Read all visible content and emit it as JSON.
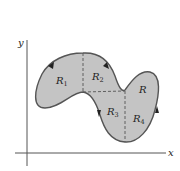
{
  "diagram": {
    "axes": {
      "x_label": "x",
      "y_label": "y"
    },
    "region": {
      "label": "R",
      "fill": "#c4c4c4",
      "outline": "#555555",
      "subregions": [
        {
          "name": "R",
          "sub": "1"
        },
        {
          "name": "R",
          "sub": "2"
        },
        {
          "name": "R",
          "sub": "3"
        },
        {
          "name": "R",
          "sub": "4"
        }
      ],
      "orientation": "counterclockwise"
    }
  }
}
